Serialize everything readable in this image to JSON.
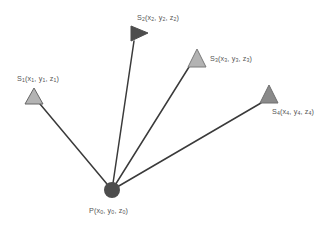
{
  "figure": {
    "background_color": "#ffffff",
    "width": 336,
    "height": 233
  },
  "nodes": {
    "p": {
      "id": "P",
      "label_html": "P(x<sub>0</sub>, y<sub>0</sub>, z<sub>0</sub>)",
      "label_text": "P(x0, y0, z0)",
      "marker": "circle",
      "fill_color": "#4d4d4d",
      "x": 112,
      "y": 190,
      "radius": 8
    },
    "stations": [
      {
        "id": "S1",
        "label_html": "S<sub>1</sub>(x<sub>1</sub>, y<sub>1</sub>, z<sub>1</sub>)",
        "label_text": "S1(x1, y1, z1)",
        "marker": "triangle-up",
        "fill_color": "#b3b3b3",
        "stroke_color": "#666666",
        "x": 34,
        "y": 97,
        "size": 15,
        "link_from_x": 40,
        "link_from_y": 104
      },
      {
        "id": "S2",
        "label_html": "S<sub>2</sub>(x<sub>2</sub>, y<sub>2</sub>, z<sub>2</sub>)",
        "label_text": "S2(x2, y2, z2)",
        "marker": "triangle-right",
        "fill_color": "#4d4d4d",
        "stroke_color": "#4d4d4d",
        "x": 137,
        "y": 33,
        "size": 15,
        "link_from_x": 134,
        "link_from_y": 41
      },
      {
        "id": "S3",
        "label_html": "S<sub>3</sub>(x<sub>3</sub>, y<sub>3</sub>, z<sub>3</sub>)",
        "label_text": "S3(x3, y3, z3)",
        "marker": "triangle-up",
        "fill_color": "#b3b3b3",
        "stroke_color": "#7a7a7a",
        "x": 196,
        "y": 58,
        "size": 16,
        "link_from_x": 189,
        "link_from_y": 67
      },
      {
        "id": "S4",
        "label_html": "S<sub>4</sub>(x<sub>4</sub>, y<sub>4</sub>, z<sub>4</sub>)",
        "label_text": "S4(x4, y4, z4)",
        "marker": "triangle-up",
        "fill_color": "#8a8a8a",
        "stroke_color": "#6e6e6e",
        "x": 268,
        "y": 94,
        "size": 16,
        "link_from_x": 261,
        "link_from_y": 103
      }
    ]
  },
  "edges": [
    {
      "id": "edge-p-s1",
      "from": "P",
      "to": "S1",
      "color": "#3a3a3a",
      "width": 1.5
    },
    {
      "id": "edge-p-s2",
      "from": "P",
      "to": "S2",
      "color": "#3a3a3a",
      "width": 1.5
    },
    {
      "id": "edge-p-s3",
      "from": "P",
      "to": "S3",
      "color": "#3a3a3a",
      "width": 1.5
    },
    {
      "id": "edge-p-s4",
      "from": "P",
      "to": "S4",
      "color": "#3a3a3a",
      "width": 1.5
    }
  ]
}
